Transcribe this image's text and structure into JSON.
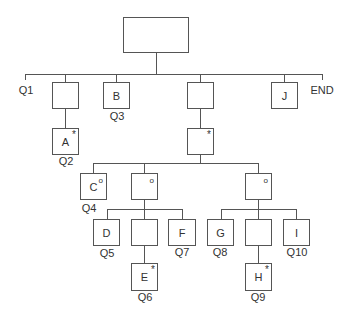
{
  "diagram": {
    "type": "tree",
    "markers": {
      "asterisk": "*",
      "circle": "o"
    },
    "nodes": {
      "root": {
        "label": ""
      },
      "n1": {
        "label": ""
      },
      "a": {
        "label": "A",
        "marker": "*"
      },
      "b": {
        "label": "B"
      },
      "n3": {
        "label": ""
      },
      "n3c": {
        "label": "",
        "marker": "*"
      },
      "j": {
        "label": "J"
      },
      "c": {
        "label": "C",
        "marker": "o"
      },
      "n4": {
        "label": "",
        "marker": "o"
      },
      "n5": {
        "label": "",
        "marker": "o"
      },
      "d": {
        "label": "D"
      },
      "n4m": {
        "label": ""
      },
      "f": {
        "label": "F"
      },
      "e": {
        "label": "E",
        "marker": "*"
      },
      "g": {
        "label": "G"
      },
      "n5m": {
        "label": ""
      },
      "i": {
        "label": "I"
      },
      "h": {
        "label": "H",
        "marker": "*"
      }
    },
    "labels": {
      "q1": "Q1",
      "end": "END",
      "q2": "Q2",
      "q3": "Q3",
      "q4": "Q4",
      "q5": "Q5",
      "q6": "Q6",
      "q7": "Q7",
      "q8": "Q8",
      "q9": "Q9",
      "q10": "Q10"
    }
  }
}
